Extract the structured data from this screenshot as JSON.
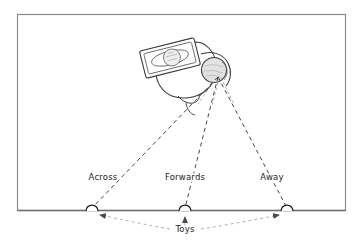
{
  "figure": {
    "background_color": "#ffffff",
    "line_color": "#2a2a2a",
    "text_color": "#1d1d1d",
    "frame": {
      "name": "outer-border",
      "x": 17,
      "y": 14,
      "width": 329,
      "height": 197,
      "stroke": "#8a8a8a"
    },
    "baseline": {
      "name": "floor-line",
      "y": 211,
      "x_start": 17,
      "x_end": 346,
      "stroke": "#6e6e6e"
    }
  },
  "actor": {
    "name": "seated-infant",
    "head": {
      "name": "infant-head",
      "cx": 214,
      "cy": 70,
      "r": 12.5,
      "fill": "#e2e2e2"
    },
    "tray": {
      "name": "tray-table",
      "inner_circle_label": "",
      "rotation_deg": -14
    },
    "gaze_origin": {
      "x": 218,
      "y": 77
    }
  },
  "targets": [
    {
      "name": "toy-across",
      "label": "Across",
      "x": 92,
      "y": 211,
      "label_x": 103,
      "label_y": 180,
      "radius": 6
    },
    {
      "name": "toy-forwards",
      "label": "Forwards",
      "x": 185,
      "y": 211,
      "label_x": 185,
      "label_y": 180,
      "radius": 6
    },
    {
      "name": "toy-away",
      "label": "Away",
      "x": 287,
      "y": 211,
      "label_x": 272,
      "label_y": 180,
      "radius": 6
    }
  ],
  "annotations": {
    "toys_caption": {
      "name": "toys-caption",
      "label": "Toys",
      "x": 185,
      "y": 232
    }
  },
  "legend": {
    "gaze_line_style": "dashed",
    "pointer_line_style": "dashed-with-arrowhead"
  }
}
